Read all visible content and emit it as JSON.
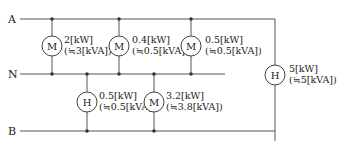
{
  "buses": {
    "A": "A",
    "N": "N",
    "B": "B"
  },
  "loads": [
    {
      "symbol": "M",
      "line1": "2[kW]",
      "line2": "(≒3[kVA])",
      "between": "A-N"
    },
    {
      "symbol": "M",
      "line1": "0.4[kW]",
      "line2": "(≒0.5[kVA])",
      "between": "A-N"
    },
    {
      "symbol": "M",
      "line1": "0.5[kW]",
      "line2": "(≒0.5[kVA])",
      "between": "A-N"
    },
    {
      "symbol": "H",
      "line1": "0.5[kW]",
      "line2": "(≒0.5[kVA])",
      "between": "N-B"
    },
    {
      "symbol": "M",
      "line1": "3.2[kW]",
      "line2": "(≒3.8[kVA])",
      "between": "N-B"
    },
    {
      "symbol": "H",
      "line1": "5[kW]",
      "line2": "(≒5[kVA])",
      "between": "A-B"
    }
  ]
}
